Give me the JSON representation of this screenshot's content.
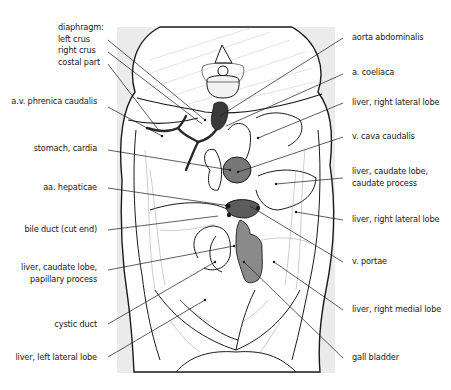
{
  "diagram": {
    "colors": {
      "background_panel": "#e9e9e9",
      "outline": "#1a1a1a",
      "vessel_fill": "#6e6e6e",
      "vessel_dark": "#3c3c3c",
      "leader_line": "#1a1a1a",
      "vertebra_fill": "#f4f4f4"
    },
    "labels_left": [
      {
        "id": "diaphragm",
        "lines": [
          "diaphragm:",
          "left crus",
          "right crus",
          "costal part"
        ]
      },
      {
        "id": "av-phrenica-caudalis",
        "lines": [
          "a.v. phrenica caudalis"
        ]
      },
      {
        "id": "stomach-cardia",
        "lines": [
          "stomach, cardia"
        ]
      },
      {
        "id": "aa-hepaticae",
        "lines": [
          "aa. hepaticae"
        ]
      },
      {
        "id": "bile-duct-cut-end",
        "lines": [
          "bile duct (cut end)"
        ]
      },
      {
        "id": "liver-caudate-papillary",
        "lines": [
          "liver, caudate lobe,",
          "papillary process"
        ]
      },
      {
        "id": "cystic-duct",
        "lines": [
          "cystic duct"
        ]
      },
      {
        "id": "liver-left-lateral-lobe",
        "lines": [
          "liver, left lateral lobe"
        ]
      }
    ],
    "labels_right": [
      {
        "id": "aorta-abdominalis",
        "lines": [
          "aorta abdominalis"
        ]
      },
      {
        "id": "a-coeliaca",
        "lines": [
          "a. coeliaca"
        ]
      },
      {
        "id": "liver-right-lateral-lobe-top",
        "lines": [
          "liver, right lateral lobe"
        ]
      },
      {
        "id": "v-cava-caudalis",
        "lines": [
          "v. cava caudalis"
        ]
      },
      {
        "id": "liver-caudate-caudate-process",
        "lines": [
          "liver, caudate lobe,",
          "caudate process"
        ]
      },
      {
        "id": "liver-right-lateral-lobe",
        "lines": [
          "liver, right lateral lobe"
        ]
      },
      {
        "id": "v-portae",
        "lines": [
          "v. portae"
        ]
      },
      {
        "id": "liver-right-medial-lobe",
        "lines": [
          "liver, right medial lobe"
        ]
      },
      {
        "id": "gall-bladder",
        "lines": [
          "gall bladder"
        ]
      }
    ]
  }
}
